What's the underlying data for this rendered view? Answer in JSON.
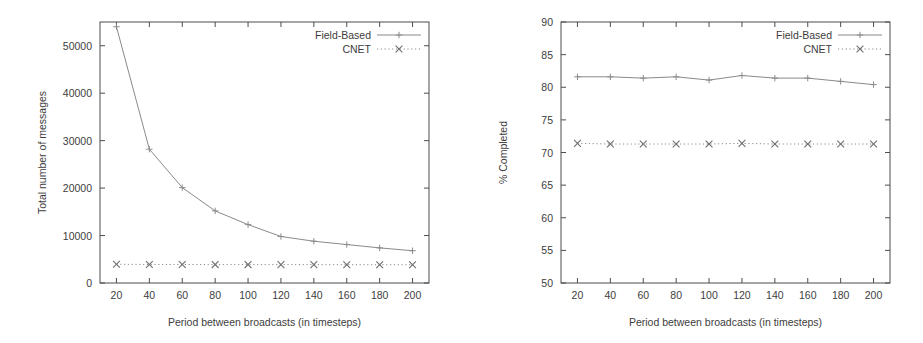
{
  "figure": {
    "background": "#ffffff",
    "line_color": "#8a8a8a",
    "axis_color": "#4d4d4d",
    "text_color": "#3d3d3d"
  },
  "panels": [
    {
      "id": "left",
      "name": "total-messages-chart"
    },
    {
      "id": "right",
      "name": "percent-completed-chart"
    }
  ],
  "chart_data": [
    {
      "type": "line",
      "title": "",
      "xlabel": "Period between broadcasts (in timesteps)",
      "ylabel": "Total number of messages",
      "x": [
        20,
        40,
        60,
        80,
        100,
        120,
        140,
        160,
        180,
        200
      ],
      "xlim": [
        10,
        210
      ],
      "ylim": [
        0,
        55000
      ],
      "xticks": [
        20,
        40,
        60,
        80,
        100,
        120,
        140,
        160,
        180,
        200
      ],
      "xticklabels": [
        "20",
        "40",
        "60",
        "80",
        "100",
        "120",
        "140",
        "160",
        "180",
        "200"
      ],
      "yticks": [
        0,
        10000,
        20000,
        30000,
        40000,
        50000
      ],
      "yticklabels": [
        "0",
        "10000",
        "20000",
        "30000",
        "40000",
        "50000"
      ],
      "grid": false,
      "legend_position": "top-right",
      "series": [
        {
          "name": "Field-Based",
          "style": "solid",
          "marker": "plus",
          "values": [
            54000,
            28200,
            20100,
            15200,
            12300,
            9800,
            8800,
            8100,
            7400,
            6800
          ]
        },
        {
          "name": "CNET",
          "style": "dotted",
          "marker": "cross",
          "values": [
            3950,
            3900,
            3900,
            3880,
            3880,
            3870,
            3870,
            3860,
            3860,
            3850
          ]
        }
      ]
    },
    {
      "type": "line",
      "title": "",
      "xlabel": "Period between broadcasts (in timesteps)",
      "ylabel": "% Completed",
      "x": [
        20,
        40,
        60,
        80,
        100,
        120,
        140,
        160,
        180,
        200
      ],
      "xlim": [
        10,
        210
      ],
      "ylim": [
        50,
        90
      ],
      "xticks": [
        20,
        40,
        60,
        80,
        100,
        120,
        140,
        160,
        180,
        200
      ],
      "xticklabels": [
        "20",
        "40",
        "60",
        "80",
        "100",
        "120",
        "140",
        "160",
        "180",
        "200"
      ],
      "yticks": [
        50,
        55,
        60,
        65,
        70,
        75,
        80,
        85,
        90
      ],
      "yticklabels": [
        "50",
        "55",
        "60",
        "65",
        "70",
        "75",
        "80",
        "85",
        "90"
      ],
      "grid": false,
      "legend_position": "top-right",
      "series": [
        {
          "name": "Field-Based",
          "style": "solid",
          "marker": "plus",
          "values": [
            81.6,
            81.6,
            81.4,
            81.6,
            81.1,
            81.8,
            81.4,
            81.4,
            80.9,
            80.4
          ]
        },
        {
          "name": "CNET",
          "style": "dotted",
          "marker": "cross",
          "values": [
            71.4,
            71.3,
            71.3,
            71.3,
            71.3,
            71.4,
            71.3,
            71.3,
            71.3,
            71.3
          ]
        }
      ]
    }
  ]
}
